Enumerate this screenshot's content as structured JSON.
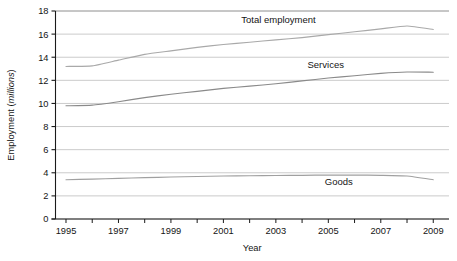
{
  "figure": {
    "cropped_top_text": "",
    "background_color": "#ffffff"
  },
  "chart_data": {
    "type": "line",
    "title": "",
    "xlabel": "Year",
    "ylabel": "Employment (millions)",
    "ylabel_plain": "Employment (",
    "ylabel_italic": "millions",
    "ylabel_tail": ")",
    "x": [
      1995,
      1996,
      1997,
      1998,
      1999,
      2000,
      2001,
      2002,
      2003,
      2004,
      2005,
      2006,
      2007,
      2008,
      2009
    ],
    "xlim": [
      1994.6,
      2009.6
    ],
    "ylim": [
      0,
      18
    ],
    "yticks": [
      0,
      2,
      4,
      6,
      8,
      10,
      12,
      14,
      16,
      18
    ],
    "ytick_labels": [
      "0",
      "2",
      "4",
      "6",
      "8",
      "10",
      "12",
      "14",
      "16",
      "18"
    ],
    "xticks": [
      1995,
      1996,
      1997,
      1998,
      1999,
      2000,
      2001,
      2002,
      2003,
      2004,
      2005,
      2006,
      2007,
      2008,
      2009
    ],
    "xtick_labels": [
      "1995",
      "",
      "1997",
      "",
      "1999",
      "",
      "2001",
      "",
      "2003",
      "",
      "2005",
      "",
      "2007",
      "",
      "2009"
    ],
    "grid": "horizontal",
    "grid_color": "#b9b9b9",
    "legend": "inline-labels",
    "series": [
      {
        "name": "Total employment",
        "color": "#a9a9a9",
        "label_x": 2003.1,
        "label_y": 16.95,
        "values": [
          13.2,
          13.25,
          13.75,
          14.25,
          14.55,
          14.85,
          15.1,
          15.3,
          15.5,
          15.7,
          15.95,
          16.2,
          16.45,
          16.7,
          16.4
        ]
      },
      {
        "name": "Services",
        "color": "#8a8a8a",
        "label_x": 2004.9,
        "label_y": 13.1,
        "values": [
          9.8,
          9.85,
          10.15,
          10.5,
          10.8,
          11.05,
          11.3,
          11.5,
          11.7,
          11.95,
          12.2,
          12.4,
          12.6,
          12.72,
          12.7
        ]
      },
      {
        "name": "Goods",
        "color": "#a0a0a0",
        "label_x": 2005.4,
        "label_y": 2.95,
        "values": [
          3.4,
          3.45,
          3.52,
          3.58,
          3.63,
          3.68,
          3.72,
          3.74,
          3.76,
          3.78,
          3.8,
          3.8,
          3.78,
          3.72,
          3.4
        ]
      }
    ]
  }
}
